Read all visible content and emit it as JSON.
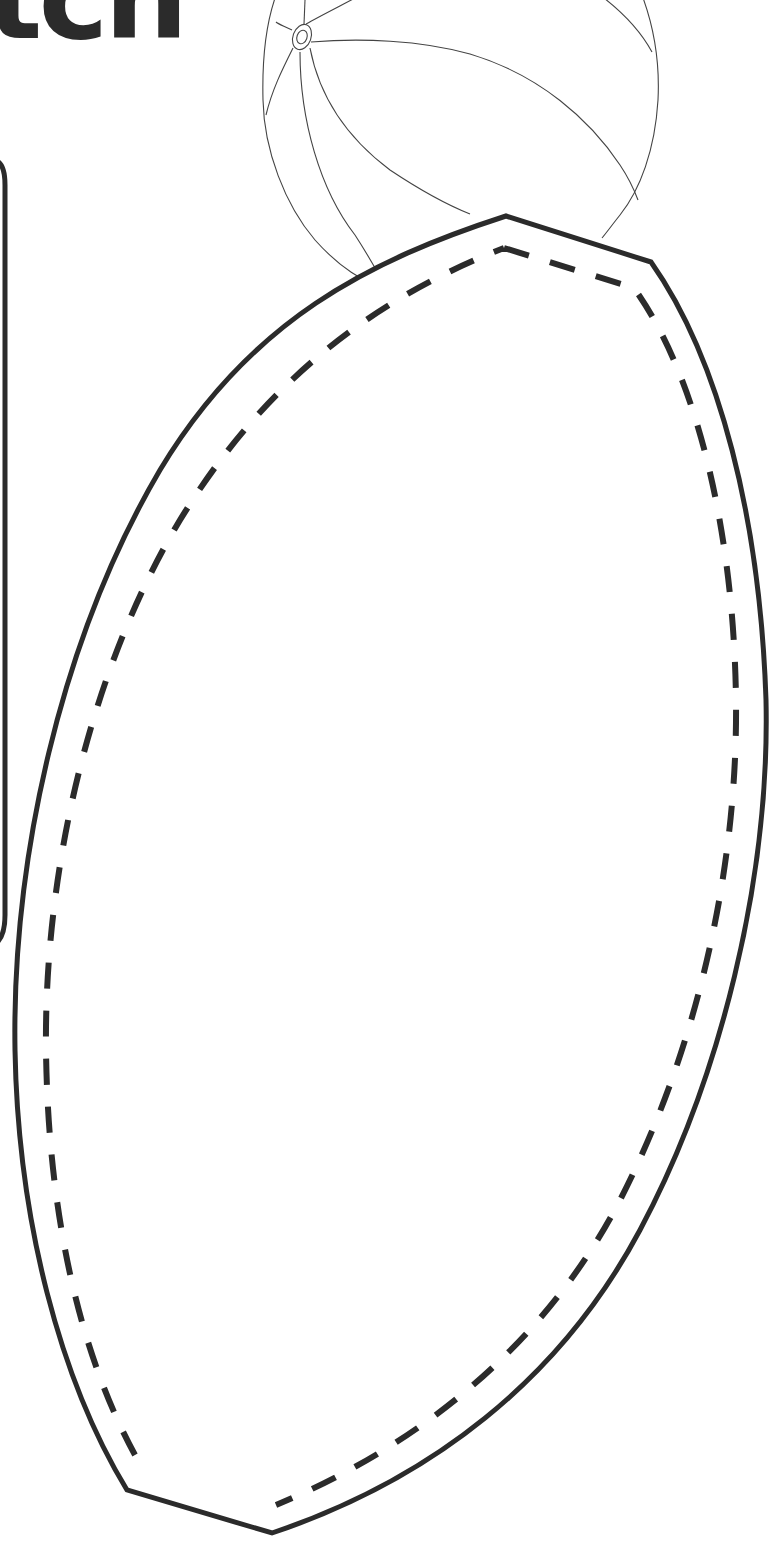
{
  "page": {
    "title_fragment": "tch",
    "background_color": "#ffffff",
    "ink_color": "#2b2b2b"
  },
  "template": {
    "shape": "football",
    "cut_line": "solid",
    "fold_line": "dashed"
  },
  "illustration": {
    "subject": "beach-ball",
    "style": "line-art"
  },
  "side_panel": {
    "style": "rounded-border"
  }
}
